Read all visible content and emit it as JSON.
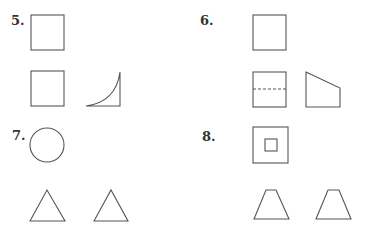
{
  "problems": [
    {
      "number": "5.",
      "label_pos": [
        11,
        13
      ],
      "top_view": "square",
      "front_view": "square",
      "side_view": "quarter-curve"
    },
    {
      "number": "6.",
      "label_pos": [
        200,
        13
      ],
      "top_view": "square",
      "front_view": "square-with-dashed-line",
      "side_view": "sloped-trapezoid"
    },
    {
      "number": "7.",
      "label_pos": [
        12,
        128
      ],
      "top_view": "circle",
      "front_view": "triangle",
      "side_view": "triangle"
    },
    {
      "number": "8.",
      "label_pos": [
        202,
        129
      ],
      "top_view": "square-with-inner-square",
      "front_view": "trapezoid",
      "side_view": "trapezoid"
    }
  ]
}
